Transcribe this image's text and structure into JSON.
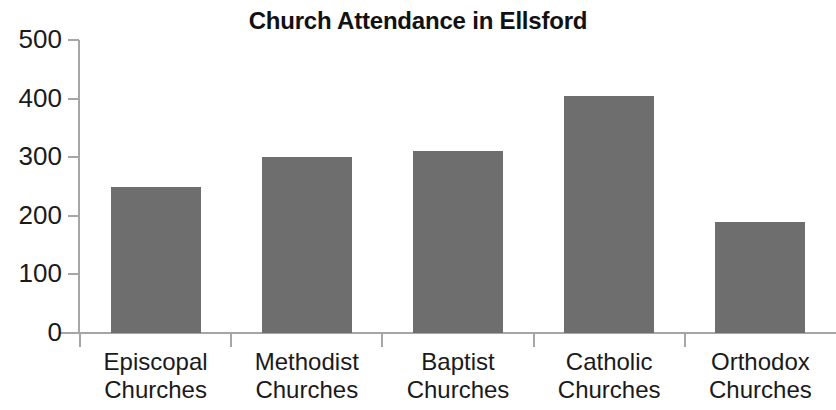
{
  "chart_data": {
    "type": "bar",
    "title": "Church Attendance in Ellsford",
    "xlabel": "",
    "ylabel": "",
    "categories": [
      "Episcopal Churches",
      "Methodist Churches",
      "Baptist Churches",
      "Catholic Churches",
      "Orthodox Churches"
    ],
    "category_lines": [
      [
        "Episcopal",
        "Churches"
      ],
      [
        "Methodist",
        "Churches"
      ],
      [
        "Baptist",
        "Churches"
      ],
      [
        "Catholic",
        "Churches"
      ],
      [
        "Orthodox",
        "Churches"
      ]
    ],
    "values": [
      250,
      300,
      310,
      405,
      190
    ],
    "ylim": [
      0,
      500
    ],
    "ytick_labels": [
      "500",
      "400",
      "300",
      "200",
      "100",
      "0"
    ],
    "ytick_values": [
      500,
      400,
      300,
      200,
      100,
      0
    ],
    "grid": false,
    "legend": false,
    "bar_color": "#6e6e6e",
    "axis_color": "#a6a6a6",
    "text_color": "#1a1a1a",
    "title_color": "#111111",
    "background": "#ffffff"
  }
}
